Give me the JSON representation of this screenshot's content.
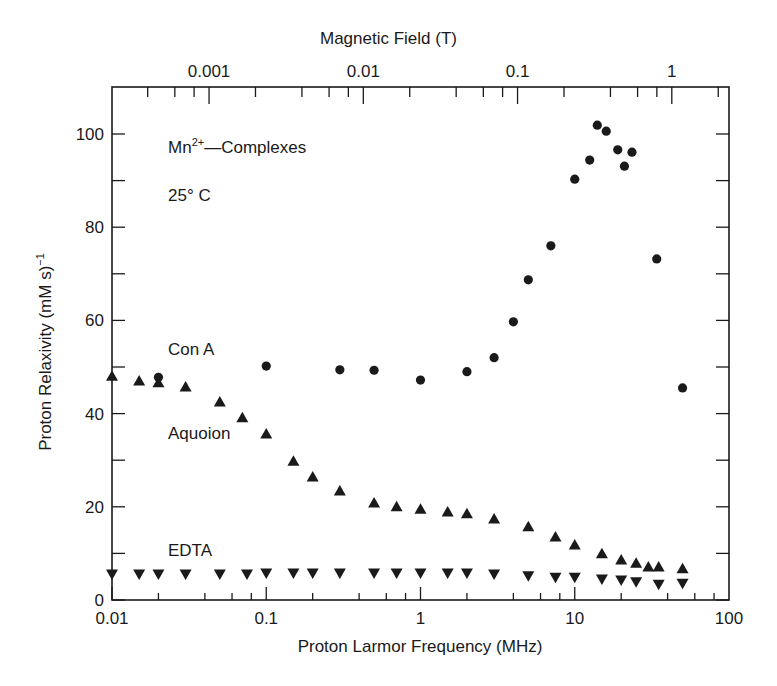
{
  "chart_data": {
    "type": "scatter",
    "title": "",
    "xlabel": "Proton Larmor Frequency (MHz)",
    "x2label": "Magnetic Field (T)",
    "ylabel": "Proton Relaxivity (mM s)",
    "ylabel_superscript": "-1",
    "xscale": "log",
    "xlim": [
      0.01,
      100
    ],
    "ylim": [
      0,
      110
    ],
    "xticks": [
      0.01,
      0.1,
      1,
      10,
      100
    ],
    "xtick_labels": [
      "0.01",
      "0.1",
      "1",
      "10",
      "100"
    ],
    "x2ticks": [
      0.001,
      0.01,
      0.1,
      1
    ],
    "x2tick_labels": [
      "0.001",
      "0.01",
      "0.1",
      "1"
    ],
    "yticks": [
      0,
      20,
      40,
      60,
      80,
      100
    ],
    "ytick_labels": [
      "0",
      "20",
      "40",
      "60",
      "80",
      "100"
    ],
    "grid": false,
    "annotations": [
      {
        "text": "Mn",
        "sup": "2+",
        "rest": "—Complexes",
        "x": 170,
        "y": 145
      },
      {
        "text": "25° C",
        "x": 170,
        "y": 188
      },
      {
        "text": "Con A",
        "x": 170,
        "y": 343
      },
      {
        "text": "Aquoion",
        "x": 170,
        "y": 426
      },
      {
        "text": "EDTA",
        "x": 170,
        "y": 543
      }
    ],
    "series": [
      {
        "name": "Con A",
        "marker": "circle",
        "x": [
          0.02,
          0.1,
          0.3,
          0.5,
          1,
          2,
          3,
          4,
          5,
          7,
          10,
          12.5,
          14,
          16,
          19,
          21,
          23.5,
          34,
          50
        ],
        "y": [
          47.8,
          50.2,
          49.4,
          49.3,
          47.2,
          49,
          52,
          59.7,
          68.7,
          76,
          90.3,
          94.4,
          101.9,
          100.6,
          96.6,
          93.1,
          96.1,
          73.2,
          45.5
        ]
      },
      {
        "name": "Aquoion",
        "marker": "triangle-up",
        "x": [
          0.01,
          0.015,
          0.02,
          0.03,
          0.05,
          0.07,
          0.1,
          0.15,
          0.2,
          0.3,
          0.5,
          0.7,
          1,
          1.5,
          2,
          3,
          5,
          7.5,
          10,
          15,
          20,
          25,
          30,
          35,
          50
        ],
        "y": [
          48,
          47,
          46.6,
          45.7,
          42.5,
          39.1,
          35.6,
          29.8,
          26.4,
          23.4,
          20.8,
          20,
          19.5,
          18.9,
          18.5,
          17.4,
          15.7,
          13.5,
          11.8,
          9.9,
          8.6,
          7.9,
          7.1,
          7.1,
          6.7
        ]
      },
      {
        "name": "EDTA",
        "marker": "triangle-down",
        "x": [
          0.01,
          0.015,
          0.02,
          0.03,
          0.05,
          0.075,
          0.1,
          0.15,
          0.2,
          0.3,
          0.5,
          0.7,
          1,
          1.5,
          2,
          3,
          5,
          7.5,
          10,
          15,
          20,
          25,
          35,
          50
        ],
        "y": [
          5.6,
          5.6,
          5.6,
          5.6,
          5.6,
          5.6,
          5.8,
          5.8,
          5.8,
          5.8,
          5.8,
          5.8,
          5.8,
          5.8,
          5.8,
          5.6,
          5.2,
          4.9,
          4.9,
          4.5,
          4.3,
          3.9,
          3.4,
          3.6
        ]
      }
    ]
  },
  "labels": {
    "top_title": "Magnetic Field (T)",
    "bottom_title": "Proton Larmor Frequency (MHz)",
    "ylabel": "Proton Relaxivity (mM  s)",
    "ylabel_sup": "−1",
    "mn_base": "Mn",
    "mn_sup": "2+",
    "mn_rest": "—Complexes",
    "temp": "25° C",
    "cona": "Con A",
    "aquoion": "Aquoion",
    "edta": "EDTA"
  },
  "colors": {
    "ink": "#1a1a1a",
    "background": "#ffffff"
  }
}
